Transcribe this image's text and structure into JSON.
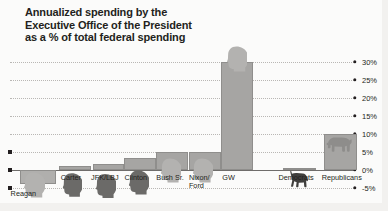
{
  "chart_data": {
    "type": "bar",
    "title": "Annualized spending by the\nExecutive Office of the President\nas a % of total federal spending",
    "xlabel": "",
    "ylabel": "",
    "ylim": [
      -5,
      30
    ],
    "grid": true,
    "legend": "none",
    "ytick_labels": [
      "30%",
      "25%",
      "20%",
      "15%",
      "10%",
      "5%",
      "0%",
      -5
    ],
    "yticks": [
      30,
      25,
      20,
      15,
      10,
      5,
      0,
      -5
    ],
    "categories": [
      "Reagan",
      "Carter",
      "JFK/LBJ",
      "Clinton",
      "Bush Sr.",
      "Nixon/\nFord",
      "GW",
      "Democrats",
      "Republicans"
    ],
    "values": [
      -4.0,
      1.2,
      1.6,
      3.2,
      5.0,
      5.0,
      30.0,
      0.6,
      10.0
    ],
    "annotations": [
      "Reagan bar is negative (spending decreased)",
      "Democrats marked with donkey silhouette",
      "Republicans marked with elephant silhouette"
    ]
  },
  "axis": {
    "labels": [
      {
        "text": "30%",
        "value": 30
      },
      {
        "text": "25%",
        "value": 25
      },
      {
        "text": "20%",
        "value": 20
      },
      {
        "text": "15%",
        "value": 15
      },
      {
        "text": "10%",
        "value": 10
      },
      {
        "text": "5%",
        "value": 5
      },
      {
        "text": "0%",
        "value": 0
      },
      {
        "text": "-5%",
        "value": -5
      }
    ]
  },
  "icons": {
    "donkey": "donkey-icon",
    "elephant": "elephant-icon",
    "president_head": "president-head-silhouette-icon"
  },
  "colors": {
    "bar_fill": "#a6a5a3",
    "bar_stroke": "#8f8e8c",
    "text": "#231f20",
    "gridline": "#b9b7b4",
    "zero_line": "#6f6d6b",
    "background": "#fbfbfa",
    "head_light": "#b3b2b0",
    "head_dark": "#6b6a68"
  }
}
